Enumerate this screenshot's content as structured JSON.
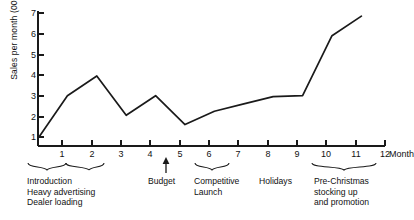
{
  "chart_data": {
    "type": "line",
    "title": "",
    "xlabel": "Month",
    "ylabel": "Sales per month (000's)",
    "x": [
      0,
      1,
      2,
      3,
      4,
      5,
      6,
      7,
      8,
      9,
      10,
      11
    ],
    "values": [
      1.0,
      3.0,
      3.95,
      2.05,
      3.0,
      1.6,
      2.25,
      2.6,
      2.95,
      3.0,
      5.9,
      6.85
    ],
    "xlim": [
      0,
      12
    ],
    "ylim": [
      0,
      7
    ],
    "xticks": [
      "1",
      "2",
      "3",
      "4",
      "5",
      "6",
      "7",
      "8",
      "9",
      "10",
      "11",
      "12"
    ],
    "yticks": [
      "1",
      "2",
      "3",
      "4",
      "5",
      "6",
      "7"
    ],
    "grid": false,
    "legend": false,
    "series": [
      {
        "name": "Sales per month",
        "values": [
          1.0,
          3.0,
          3.95,
          2.05,
          3.0,
          1.6,
          2.25,
          2.6,
          2.95,
          3.0,
          5.9,
          6.85
        ]
      }
    ],
    "annotations": [
      {
        "label": "Introduction\nHeavy advertising\nDealer loading",
        "type": "bracket",
        "span": [
          0,
          2
        ]
      },
      {
        "label": "Budget",
        "type": "arrow",
        "span": [
          4.5,
          4.5
        ]
      },
      {
        "label": "Competitive\nLaunch",
        "type": "bracket",
        "span": [
          6,
          7
        ]
      },
      {
        "label": "Holidays",
        "type": "text",
        "span": [
          8,
          9
        ]
      },
      {
        "label": "Pre-Christmas\nstocking up\nand promotion",
        "type": "bracket",
        "span": [
          10,
          12
        ]
      }
    ],
    "line_color": "#1a1a1a",
    "axis_color": "#1a1a1a"
  }
}
